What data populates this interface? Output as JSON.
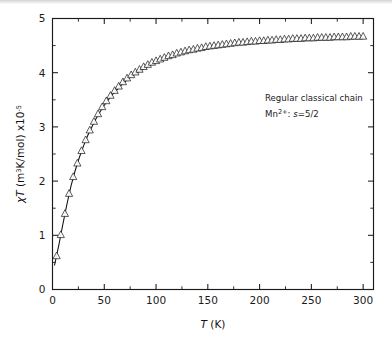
{
  "figure": {
    "background_color": "#ffffff",
    "ink_color": "#1a1a1a"
  },
  "annotations": {
    "line1": "Regular classical chain",
    "line2_prefix": "Mn",
    "line2_charge": "2+",
    "line2_rest": ": ",
    "line2_symbol": "s",
    "line2_value": "=5/2"
  },
  "axes": {
    "x_title_symbol": "T",
    "x_title_unit": " (K)",
    "y_title_symbol": "χT",
    "y_title_unit": " (m",
    "y_title_unit_sup": "3",
    "y_title_unit_rest": "K/mol) x10",
    "y_title_exp": "-5"
  },
  "chart_data": {
    "type": "scatter",
    "title": "",
    "xlabel": "T (K)",
    "ylabel": "χT (m3K/mol) x10-5",
    "xlim": [
      0,
      310
    ],
    "ylim": [
      0,
      5
    ],
    "grid": false,
    "legend": false,
    "x_ticks_major": [
      0,
      50,
      100,
      150,
      200,
      250,
      300
    ],
    "x_ticks_minor": [
      25,
      75,
      125,
      175,
      225,
      275
    ],
    "y_ticks_major": [
      0,
      1,
      2,
      3,
      4,
      5
    ],
    "y_ticks_minor": [
      0.5,
      1.5,
      2.5,
      3.5,
      4.5
    ],
    "x_tick_labels": [
      "0",
      "50",
      "100",
      "150",
      "200",
      "250",
      "300"
    ],
    "y_tick_labels": [
      "0",
      "1",
      "2",
      "3",
      "4",
      "5"
    ],
    "series": [
      {
        "name": "experimental data",
        "marker": "open-triangle-up",
        "x": [
          4,
          8,
          12,
          16,
          20,
          24,
          28,
          32,
          36,
          40,
          44,
          48,
          52,
          56,
          60,
          64,
          68,
          72,
          76,
          80,
          84,
          88,
          92,
          96,
          100,
          104,
          108,
          112,
          116,
          120,
          124,
          128,
          132,
          136,
          140,
          144,
          148,
          152,
          156,
          160,
          164,
          168,
          172,
          176,
          180,
          184,
          188,
          192,
          196,
          200,
          204,
          208,
          212,
          216,
          220,
          224,
          228,
          232,
          236,
          240,
          244,
          248,
          252,
          256,
          260,
          264,
          268,
          272,
          276,
          280,
          284,
          288,
          292,
          296,
          300
        ],
        "y": [
          0.62,
          1.01,
          1.4,
          1.77,
          2.08,
          2.33,
          2.56,
          2.76,
          2.94,
          3.1,
          3.24,
          3.37,
          3.48,
          3.58,
          3.67,
          3.75,
          3.83,
          3.9,
          3.96,
          4.01,
          4.06,
          4.11,
          4.15,
          4.19,
          4.22,
          4.25,
          4.28,
          4.31,
          4.33,
          4.36,
          4.38,
          4.4,
          4.42,
          4.43,
          4.45,
          4.46,
          4.48,
          4.49,
          4.5,
          4.51,
          4.52,
          4.53,
          4.54,
          4.55,
          4.56,
          4.56,
          4.57,
          4.58,
          4.58,
          4.59,
          4.59,
          4.6,
          4.6,
          4.61,
          4.61,
          4.62,
          4.62,
          4.63,
          4.63,
          4.63,
          4.64,
          4.64,
          4.64,
          4.65,
          4.65,
          4.65,
          4.65,
          4.66,
          4.66,
          4.66,
          4.66,
          4.67,
          4.67,
          4.67,
          4.67
        ]
      },
      {
        "name": "theoretical fit",
        "marker": "none",
        "line": "solid",
        "x": [
          2,
          6,
          10,
          14,
          18,
          22,
          26,
          30,
          34,
          38,
          42,
          46,
          50,
          54,
          58,
          62,
          66,
          70,
          74,
          78,
          82,
          86,
          90,
          94,
          98,
          102,
          106,
          110,
          114,
          118,
          122,
          126,
          130,
          134,
          138,
          142,
          146,
          150,
          154,
          158,
          162,
          166,
          170,
          174,
          178,
          182,
          186,
          190,
          194,
          198,
          202,
          206,
          210,
          214,
          218,
          222,
          226,
          230,
          234,
          238,
          242,
          246,
          250,
          254,
          258,
          262,
          266,
          270,
          274,
          278,
          282,
          286,
          290,
          294,
          298,
          302
        ],
        "y": [
          0.45,
          0.81,
          1.2,
          1.58,
          1.92,
          2.2,
          2.44,
          2.65,
          2.84,
          3.0,
          3.15,
          3.28,
          3.4,
          3.5,
          3.6,
          3.68,
          3.76,
          3.83,
          3.9,
          3.95,
          4.0,
          4.05,
          4.09,
          4.13,
          4.17,
          4.2,
          4.23,
          4.26,
          4.28,
          4.31,
          4.33,
          4.35,
          4.37,
          4.39,
          4.4,
          4.42,
          4.43,
          4.45,
          4.46,
          4.47,
          4.48,
          4.49,
          4.5,
          4.51,
          4.52,
          4.52,
          4.53,
          4.54,
          4.54,
          4.55,
          4.56,
          4.56,
          4.57,
          4.57,
          4.58,
          4.58,
          4.58,
          4.59,
          4.59,
          4.6,
          4.6,
          4.6,
          4.61,
          4.61,
          4.61,
          4.62,
          4.62,
          4.62,
          4.62,
          4.63,
          4.63,
          4.63,
          4.63,
          4.64,
          4.64,
          4.64
        ]
      }
    ]
  }
}
